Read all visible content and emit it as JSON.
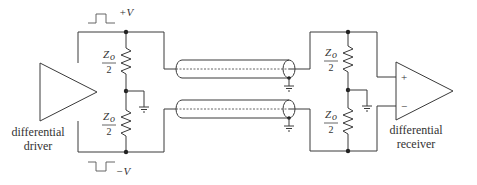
{
  "diagram": {
    "type": "differential transmission line termination circuit",
    "driver": {
      "label_line1": "differential",
      "label_line2": "driver"
    },
    "receiver": {
      "label_line1": "differential",
      "label_line2": "receiver",
      "plus_input": "+",
      "minus_input": "−"
    },
    "signals": {
      "positive": "+V",
      "negative": "−V"
    },
    "resistors": {
      "numerator": "Z",
      "subscript": "o",
      "denominator": "2"
    },
    "colors": {
      "line": "#3a3a3a",
      "background": "#ffffff"
    }
  }
}
